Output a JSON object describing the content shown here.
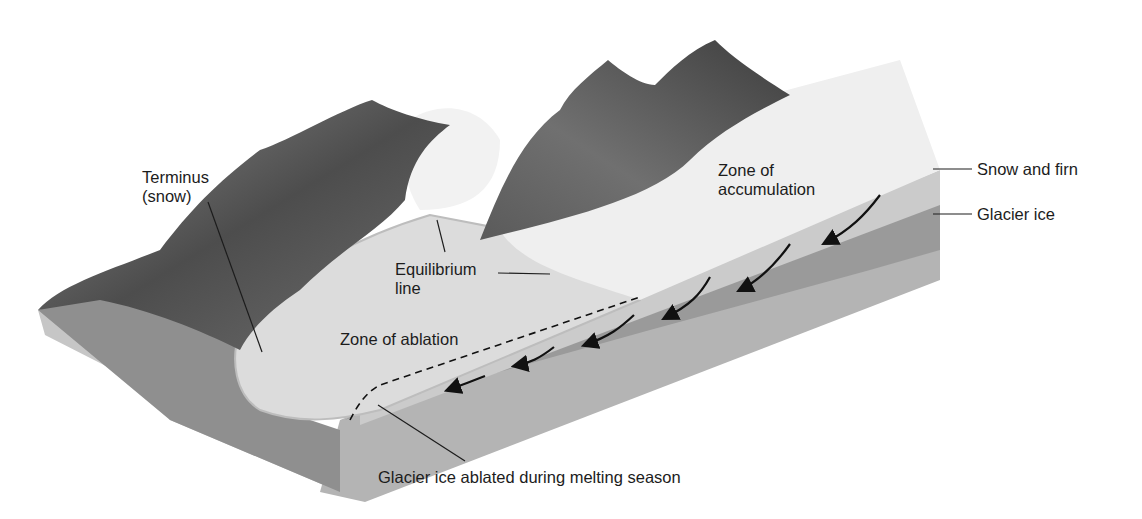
{
  "diagram": {
    "labels": {
      "terminus": "Terminus\n(snow)",
      "equilibrium_line": "Equilibrium\nline",
      "zone_of_ablation": "Zone of ablation",
      "zone_of_accumulation": "Zone of\naccumulation",
      "snow_and_firn": "Snow and firn",
      "glacier_ice": "Glacier ice",
      "ablated_ice": "Glacier ice ablated during melting season"
    },
    "colors": {
      "background": "#ffffff",
      "snow_surface": "#ececec",
      "ablation_surface": "#d9d9d9",
      "snow_firn_layer": "#cfcfcf",
      "glacier_ice_layer": "#9e9e9e",
      "bedrock_side": "#b8b8b8",
      "mountain_dark": "#4a4a4a",
      "mountain_mid": "#7a7a7a",
      "leader_line": "#1c1c1c",
      "flow_arrow": "#111111"
    },
    "flow_arrows_count": 7
  }
}
